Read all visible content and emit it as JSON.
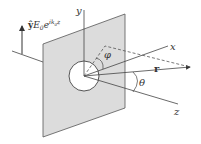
{
  "diagram": {
    "incident_field_label": {
      "unit_vector": "ŷ",
      "field": "E",
      "field_sub": "0",
      "exp_base": "e",
      "exponent": "ik",
      "exponent_sub": "0",
      "exponent_var": "z"
    },
    "axes": {
      "x": "x",
      "y": "y",
      "z": "z"
    },
    "position_vector": "r",
    "angles": {
      "polar": "θ",
      "azimuthal": "φ"
    },
    "colors": {
      "screen_fill": "#dcdcdc",
      "line": "#444444",
      "aperture_fill": "#ffffff"
    }
  }
}
